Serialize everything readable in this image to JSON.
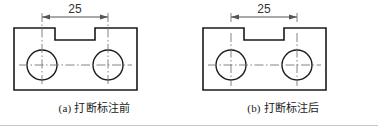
{
  "figures": [
    {
      "id": "figure-a",
      "caption": "(a) 打断标注前",
      "dimension_value": "25",
      "extension_lines_broken": false
    },
    {
      "id": "figure-b",
      "caption": "(b) 打断标注后",
      "dimension_value": "25",
      "extension_lines_broken": true
    }
  ],
  "colors": {
    "outline": "#1a1a1a",
    "dimension": "#555555",
    "centerline": "#777777",
    "rule": "#c8c8c8",
    "background": "#ffffff"
  }
}
